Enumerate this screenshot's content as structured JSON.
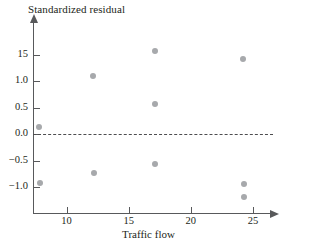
{
  "chart_data": {
    "type": "scatter",
    "title": "Standardized residual",
    "xlabel": "Traffic flow",
    "ylabel": "Standardized residual",
    "grid": false,
    "legend": null,
    "xlim": [
      6.5,
      27.0
    ],
    "ylim": [
      -1.45,
      1.95
    ],
    "xticks": [
      10,
      15,
      20,
      25
    ],
    "xticklabels": [
      "10",
      "15",
      "20",
      "25"
    ],
    "yticks": [
      1.5,
      1.0,
      0.5,
      0.0,
      -0.5,
      -1.0
    ],
    "yticklabels": [
      "15",
      "1.0",
      "0.5",
      "0.0",
      "−0.5",
      "−1.0"
    ],
    "reference_line": {
      "type": "horizontal-dashed",
      "y": 0.0
    },
    "x": [
      7.8,
      7.9,
      12.1,
      12.2,
      17.1,
      17.1,
      17.1,
      24.2,
      24.3,
      24.3
    ],
    "y": [
      0.14,
      -0.93,
      1.09,
      -0.74,
      1.57,
      0.56,
      -0.57,
      1.41,
      -0.94,
      -1.18
    ],
    "points": [
      {
        "x": 7.8,
        "y": 0.14
      },
      {
        "x": 7.9,
        "y": -0.93
      },
      {
        "x": 12.1,
        "y": 1.09
      },
      {
        "x": 12.2,
        "y": -0.74
      },
      {
        "x": 17.1,
        "y": 1.57
      },
      {
        "x": 17.1,
        "y": 0.56
      },
      {
        "x": 17.1,
        "y": -0.57
      },
      {
        "x": 24.2,
        "y": 1.41
      },
      {
        "x": 24.3,
        "y": -0.94
      },
      {
        "x": 24.3,
        "y": -1.18
      }
    ],
    "marker": {
      "shape": "circle",
      "color": "#a7a9ac",
      "size": 6
    },
    "colors": {
      "axis": "#58595b",
      "text": "#231f20",
      "marker": "#a7a9ac",
      "reference_line": "#4d4d4f",
      "background": "#ffffff"
    }
  }
}
